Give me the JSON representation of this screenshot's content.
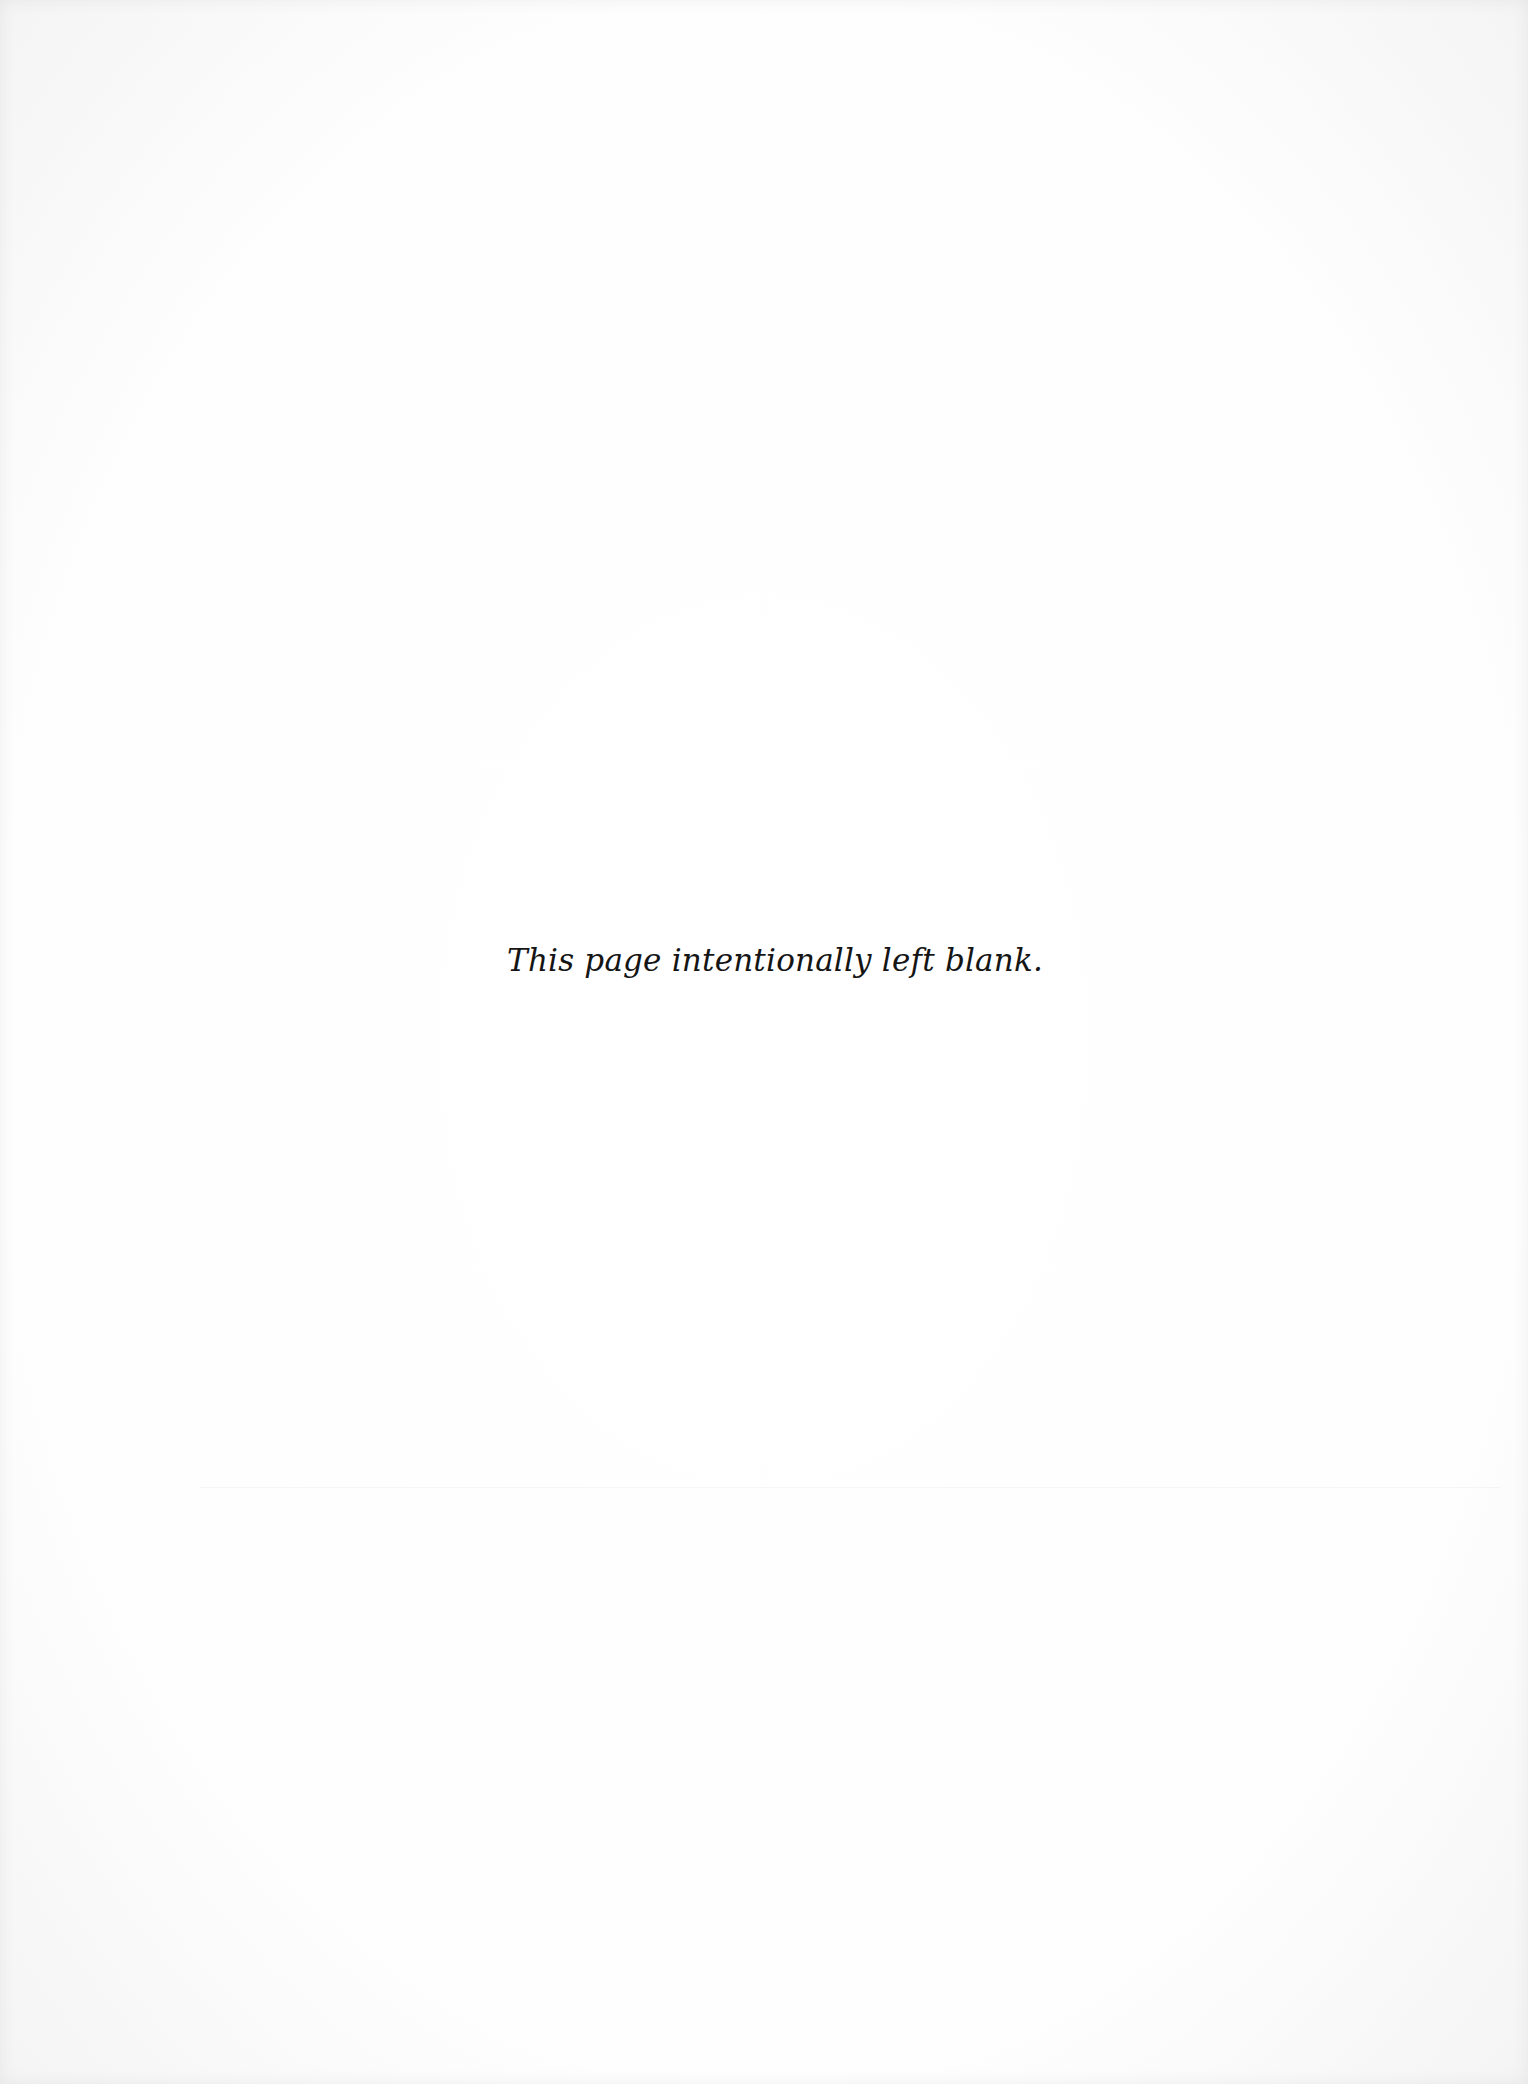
{
  "page": {
    "notice": "This page intentionally left blank.",
    "colors": {
      "background": "#fdfdfd",
      "text": "#151515"
    }
  }
}
